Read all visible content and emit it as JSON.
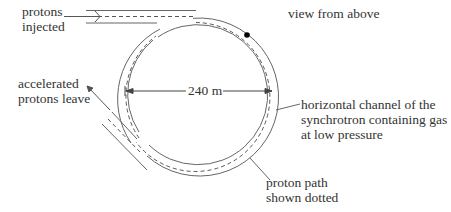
{
  "diagram": {
    "title": "view from above",
    "labels": {
      "injected": [
        "protons",
        "injected"
      ],
      "leave": [
        "accelerated",
        "protons leave"
      ],
      "diameter": "240 m",
      "channel": [
        "horizontal channel of the",
        "synchrotron containing gas",
        "at low pressure"
      ],
      "path": [
        "proton path",
        "shown dotted"
      ]
    },
    "geometry": {
      "center": [
        200,
        97
      ],
      "outer_radius": 79,
      "inner_radius": 70,
      "path_radius": 74.5
    },
    "colors": {
      "line": "#555555",
      "dot": "#000000",
      "text": "#333333"
    }
  }
}
